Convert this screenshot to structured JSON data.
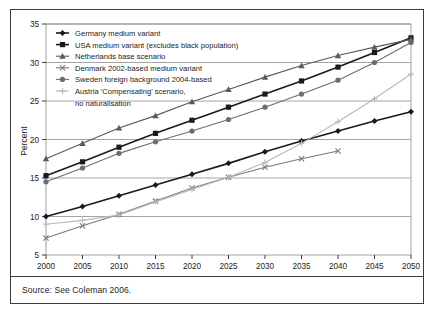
{
  "figure": {
    "source_note": "Source: See Coleman 2006.",
    "y_axis_title": "Percent"
  },
  "chart_data": {
    "type": "line",
    "title": "",
    "xlabel": "",
    "ylabel": "Percent",
    "xlim": [
      1998,
      2052
    ],
    "ylim": [
      5,
      35
    ],
    "ytick_step": 5,
    "grid": true,
    "grid_axis": "y",
    "legend_position": "top-left",
    "x": [
      2000,
      2005,
      2010,
      2015,
      2020,
      2025,
      2030,
      2035,
      2040,
      2045,
      2050
    ],
    "xticklabels": [
      "2000",
      "2005",
      "2010",
      "2015",
      "2020",
      "2025",
      "2030",
      "2035",
      "2040",
      "2045",
      "2050"
    ],
    "yticklabels": [
      "5",
      "10",
      "15",
      "20",
      "25",
      "30",
      "35"
    ],
    "yticks": [
      5,
      10,
      15,
      20,
      25,
      30,
      35
    ],
    "series": [
      {
        "name": "Germany medium variant",
        "marker": "diamond",
        "color": "#1a1a1a",
        "x": [
          2000,
          2005,
          2010,
          2015,
          2020,
          2025,
          2030,
          2035,
          2040,
          2045,
          2050
        ],
        "values": [
          10.0,
          11.3,
          12.7,
          14.1,
          15.5,
          16.9,
          18.4,
          19.8,
          21.1,
          22.4,
          23.6
        ]
      },
      {
        "name": "USA medium variant (excludes black population)",
        "marker": "square",
        "color": "#1a1a1a",
        "x": [
          2000,
          2005,
          2010,
          2015,
          2020,
          2025,
          2030,
          2035,
          2040,
          2045,
          2050
        ],
        "values": [
          15.3,
          17.1,
          19.0,
          20.8,
          22.5,
          24.2,
          25.9,
          27.6,
          29.4,
          31.3,
          33.2
        ]
      },
      {
        "name": "Netherlands base scenario",
        "marker": "triangle",
        "color": "#5a5a5a",
        "x": [
          2000,
          2005,
          2010,
          2015,
          2020,
          2025,
          2030,
          2035,
          2040,
          2045,
          2050
        ],
        "values": [
          17.5,
          19.5,
          21.5,
          23.1,
          24.9,
          26.5,
          28.1,
          29.6,
          30.9,
          32.0,
          33.0
        ]
      },
      {
        "name": "Denmark 2002-based medium variant",
        "marker": "x",
        "color": "#7a7a7a",
        "x": [
          2000,
          2005,
          2010,
          2015,
          2020,
          2025,
          2030,
          2035,
          2040
        ],
        "values": [
          7.2,
          8.8,
          10.3,
          12.0,
          13.7,
          15.1,
          16.4,
          17.5,
          18.5
        ]
      },
      {
        "name": "Sweden foreign background 2004-based",
        "marker": "circle",
        "color": "#6e6e6e",
        "x": [
          2000,
          2005,
          2010,
          2015,
          2020,
          2025,
          2030,
          2035,
          2040,
          2045,
          2050
        ],
        "values": [
          14.5,
          16.3,
          18.2,
          19.7,
          21.1,
          22.6,
          24.2,
          25.9,
          27.7,
          30.0,
          32.6
        ]
      },
      {
        "name": "Austria 'Compensating' scenario, no naturalisation",
        "marker": "plus",
        "color": "#b9b9b9",
        "x": [
          2000,
          2005,
          2010,
          2015,
          2020,
          2025,
          2030,
          2035,
          2040,
          2045,
          2050
        ],
        "values": [
          9.0,
          9.5,
          10.2,
          11.9,
          13.5,
          15.1,
          17.0,
          19.5,
          22.3,
          25.3,
          28.5
        ]
      }
    ],
    "legend_entries": [
      "Germany medium variant",
      "USA medium variant (excludes black population)",
      "Netherlands base scenario",
      "Denmark 2002-based medium variant",
      "Sweden foreign background 2004-based",
      "Austria 'Compensating' scenario,",
      "no naturalisation"
    ]
  }
}
